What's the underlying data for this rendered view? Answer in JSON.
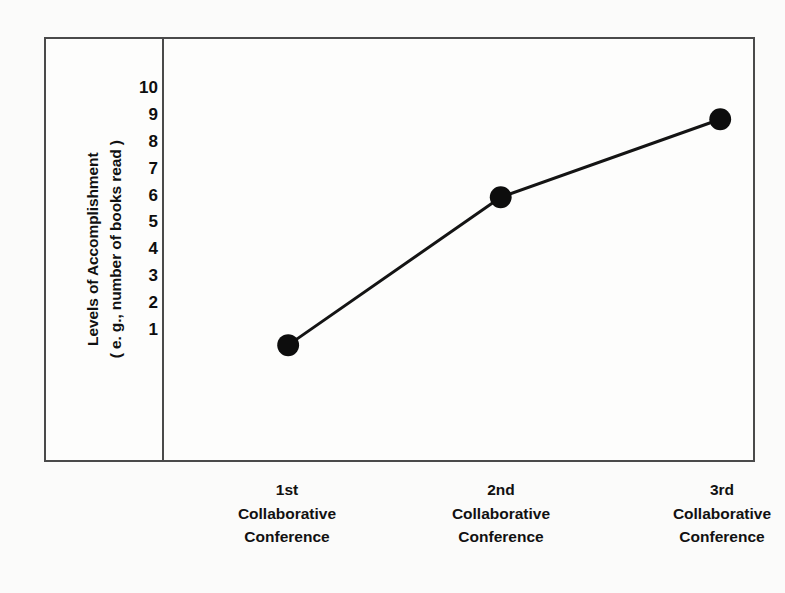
{
  "chart_data": {
    "type": "line",
    "title": "",
    "xlabel": "",
    "ylabel": "Levels of Accomplishment ( e. g., number of books read )",
    "ylabel_lines": [
      "Levels of Accomplishment",
      "( e. g., number of books read )"
    ],
    "categories": [
      "1st Collaborative Conference",
      "2nd Collaborative Conference",
      "3rd Collaborative Conference"
    ],
    "category_lines": [
      [
        "1st",
        "Collaborative",
        "Conference"
      ],
      [
        "2nd",
        "Collaborative",
        "Conference"
      ],
      [
        "3rd",
        "Collaborative",
        "Conference"
      ]
    ],
    "values": [
      0.4,
      5.9,
      8.8
    ],
    "ylim": [
      0,
      10.6
    ],
    "yticks": [
      10,
      9,
      8,
      7,
      6,
      5,
      4,
      3,
      2,
      1
    ],
    "ytick_labels": [
      "10",
      "9",
      "8",
      "7",
      "6",
      "5",
      "4",
      "3",
      "2",
      "1"
    ],
    "grid": false,
    "legend": false,
    "series": [
      {
        "name": "Levels of Accomplishment",
        "values": [
          0.4,
          5.9,
          8.8
        ],
        "marker": "filled-circle",
        "marker_color": "#0d0d0d",
        "line_color": "#141414"
      }
    ]
  },
  "style": {
    "background": "#fbfbfa",
    "plot_background": "#fdfdfc",
    "frame_color": "#4a4a4a",
    "line_color": "#141414",
    "marker_color": "#0d0d0d",
    "text_color": "#111111"
  }
}
